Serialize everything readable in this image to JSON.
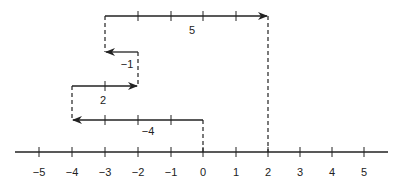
{
  "diagram": {
    "type": "number-line-vector-addition",
    "number_line": {
      "min": -5,
      "max": 5,
      "tick_labels": [
        "−5",
        "−4",
        "−3",
        "−2",
        "−1",
        "0",
        "1",
        "2",
        "3",
        "4",
        "5"
      ]
    },
    "steps": [
      {
        "label": "−4",
        "from": 0,
        "to": -4
      },
      {
        "label": "2",
        "from": -4,
        "to": -2
      },
      {
        "label": "−1",
        "from": -2,
        "to": -3
      },
      {
        "label": "5",
        "from": -3,
        "to": 2
      }
    ],
    "result": 2,
    "color": "#222222"
  }
}
